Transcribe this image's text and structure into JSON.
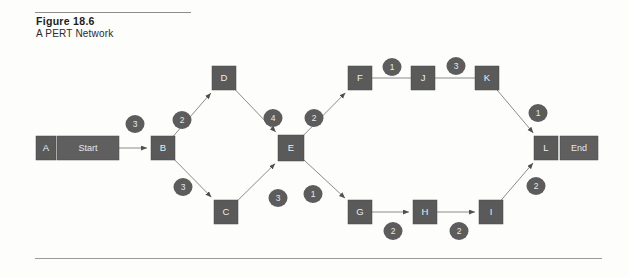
{
  "figure": {
    "number": "Figure 18.6",
    "caption": "A PERT Network"
  },
  "colors": {
    "node_fill": "#5a5a5a",
    "node_text": "#ededed",
    "weight_fill": "#5c5c5c",
    "weight_text": "#e9e9e9",
    "edge_stroke": "#8b8b8b",
    "rule": "#8d8d8d",
    "background": "#fdfdfb"
  },
  "chart_data": {
    "type": "diagram",
    "subtype": "pert-network",
    "title": "A PERT Network",
    "nodes": [
      {
        "id": "A",
        "label": "A",
        "x": 46,
        "y": 148,
        "w": 20,
        "h": 24,
        "kind": "square"
      },
      {
        "id": "Start",
        "label": "Start",
        "x": 88,
        "y": 148,
        "w": 62,
        "h": 24,
        "kind": "wide"
      },
      {
        "id": "B",
        "label": "B",
        "x": 163,
        "y": 148,
        "w": 24,
        "h": 24,
        "kind": "square"
      },
      {
        "id": "D",
        "label": "D",
        "x": 224,
        "y": 78,
        "w": 24,
        "h": 24,
        "kind": "square"
      },
      {
        "id": "C",
        "label": "C",
        "x": 226,
        "y": 212,
        "w": 24,
        "h": 24,
        "kind": "square"
      },
      {
        "id": "E",
        "label": "E",
        "x": 291,
        "y": 148,
        "w": 26,
        "h": 26,
        "kind": "square"
      },
      {
        "id": "F",
        "label": "F",
        "x": 360,
        "y": 78,
        "w": 24,
        "h": 24,
        "kind": "square"
      },
      {
        "id": "J",
        "label": "J",
        "x": 423,
        "y": 78,
        "w": 24,
        "h": 24,
        "kind": "square"
      },
      {
        "id": "K",
        "label": "K",
        "x": 487,
        "y": 78,
        "w": 24,
        "h": 24,
        "kind": "square"
      },
      {
        "id": "G",
        "label": "G",
        "x": 360,
        "y": 212,
        "w": 24,
        "h": 24,
        "kind": "square"
      },
      {
        "id": "H",
        "label": "H",
        "x": 425,
        "y": 212,
        "w": 24,
        "h": 24,
        "kind": "square"
      },
      {
        "id": "I",
        "label": "I",
        "x": 491,
        "y": 212,
        "w": 24,
        "h": 24,
        "kind": "square"
      },
      {
        "id": "L",
        "label": "L",
        "x": 546,
        "y": 148,
        "w": 24,
        "h": 24,
        "kind": "square"
      },
      {
        "id": "End",
        "label": "End",
        "x": 579,
        "y": 148,
        "w": 38,
        "h": 24,
        "kind": "wide"
      }
    ],
    "edges": [
      {
        "from": "Start",
        "to": "B",
        "weight": 3,
        "label_x": 135,
        "label_y": 124,
        "arrow": true
      },
      {
        "from": "B",
        "to": "D",
        "weight": 2,
        "label_x": 182,
        "label_y": 120,
        "arrow": true
      },
      {
        "from": "D",
        "to": "E",
        "weight": 4,
        "label_x": 273,
        "label_y": 118,
        "arrow": true
      },
      {
        "from": "B",
        "to": "C",
        "weight": 3,
        "label_x": 183,
        "label_y": 187,
        "arrow": true
      },
      {
        "from": "C",
        "to": "E",
        "weight": 3,
        "label_x": 278,
        "label_y": 198,
        "arrow": true
      },
      {
        "from": "E",
        "to": "F",
        "weight": 2,
        "label_x": 314,
        "label_y": 118,
        "arrow": true
      },
      {
        "from": "F",
        "to": "J",
        "weight": 1,
        "label_x": 392,
        "label_y": 67,
        "arrow": false
      },
      {
        "from": "J",
        "to": "K",
        "weight": 3,
        "label_x": 456,
        "label_y": 66,
        "arrow": false
      },
      {
        "from": "K",
        "to": "L",
        "weight": 1,
        "label_x": 538,
        "label_y": 113,
        "arrow": true
      },
      {
        "from": "E",
        "to": "G",
        "weight": 1,
        "label_x": 313,
        "label_y": 194,
        "arrow": true
      },
      {
        "from": "G",
        "to": "H",
        "weight": 2,
        "label_x": 393,
        "label_y": 231,
        "arrow": true
      },
      {
        "from": "H",
        "to": "I",
        "weight": 2,
        "label_x": 459,
        "label_y": 231,
        "arrow": true
      },
      {
        "from": "I",
        "to": "L",
        "weight": 2,
        "label_x": 536,
        "label_y": 186,
        "arrow": true
      }
    ],
    "node_count": 14,
    "edge_count": 13
  }
}
